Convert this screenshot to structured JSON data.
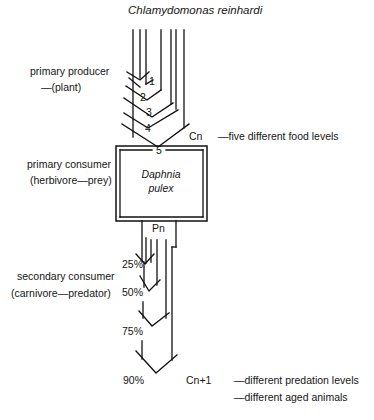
{
  "title": "Chlamydomonas reinhardi",
  "left_labels": {
    "producer_line1": "primary producer",
    "producer_line2": "—(plant)",
    "consumer_line1": "primary consumer",
    "consumer_line2": "(herbivore—prey)",
    "secondary_line1": "secondary consumer",
    "secondary_line2": "(carnivore—predator)"
  },
  "food_levels": [
    "1",
    "2",
    "3",
    "4",
    "5"
  ],
  "cn_label": "Cn",
  "cn_note": "—five different food levels",
  "box": {
    "line1": "Daphnia",
    "line2": "pulex"
  },
  "pn_label": "Pn",
  "predation_levels": [
    "25%",
    "50%",
    "75%",
    "90%"
  ],
  "cn1_label": "Cn+1",
  "cn1_notes": [
    "—different predation levels",
    "—different aged animals"
  ]
}
